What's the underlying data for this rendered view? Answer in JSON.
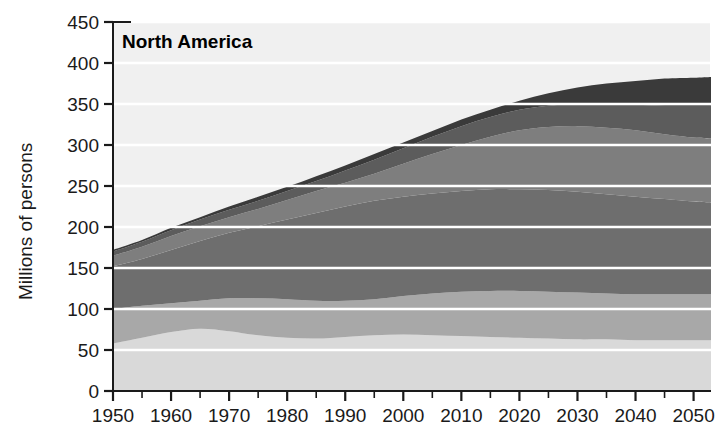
{
  "chart_data": {
    "type": "area",
    "title": "North America",
    "xlabel": "",
    "ylabel": "Millions of persons",
    "xlim": [
      1950,
      2053
    ],
    "ylim": [
      0,
      450
    ],
    "ytick_step": 50,
    "ytick_labels": [
      "0",
      "50",
      "100",
      "150",
      "200",
      "250",
      "300",
      "350",
      "400",
      "450"
    ],
    "ytick_values": [
      0,
      50,
      100,
      150,
      200,
      250,
      300,
      350,
      400,
      450
    ],
    "xtick_labels": [
      "1950",
      "1960",
      "1970",
      "1980",
      "1990",
      "2000",
      "2010",
      "2020",
      "2030",
      "2040",
      "2050"
    ],
    "xtick_values": [
      1950,
      1960,
      1970,
      1980,
      1990,
      2000,
      2010,
      2020,
      2030,
      2040,
      2050
    ],
    "minor_xtick_step": 5,
    "grid": "horizontal-white-lines",
    "legend": "none",
    "stacked": true,
    "x": [
      1950,
      1955,
      1960,
      1965,
      1970,
      1975,
      1980,
      1985,
      1990,
      1995,
      2000,
      2005,
      2010,
      2015,
      2020,
      2025,
      2030,
      2035,
      2040,
      2045,
      2050,
      2053
    ],
    "series": [
      {
        "name": "band-1-bottom",
        "color": "#d9d9d9",
        "cumulative": [
          58,
          65,
          72,
          76,
          73,
          68,
          65,
          64,
          66,
          68,
          69,
          68,
          67,
          66,
          65,
          64,
          63,
          63,
          62,
          62,
          62,
          62
        ]
      },
      {
        "name": "band-2",
        "color": "#a8a8a8",
        "cumulative": [
          100,
          104,
          107,
          110,
          113,
          113,
          112,
          110,
          110,
          112,
          116,
          119,
          121,
          122,
          122,
          121,
          120,
          119,
          118,
          118,
          118,
          118
        ]
      },
      {
        "name": "band-3",
        "color": "#6e6e6e",
        "cumulative": [
          152,
          161,
          172,
          183,
          193,
          201,
          209,
          217,
          225,
          232,
          237,
          241,
          244,
          246,
          246,
          245,
          243,
          240,
          237,
          234,
          231,
          230
        ]
      },
      {
        "name": "band-4",
        "color": "#7e7e7e",
        "cumulative": [
          165,
          176,
          189,
          201,
          212,
          222,
          233,
          244,
          254,
          265,
          277,
          289,
          300,
          310,
          318,
          322,
          323,
          321,
          318,
          313,
          309,
          308
        ]
      },
      {
        "name": "band-5",
        "color": "#5c5c5c",
        "cumulative": [
          170,
          182,
          196,
          209,
          221,
          232,
          244,
          256,
          269,
          282,
          296,
          310,
          323,
          334,
          343,
          348,
          350,
          350,
          349,
          348,
          348,
          348
        ]
      },
      {
        "name": "band-6-top",
        "color": "#3a3a3a",
        "cumulative": [
          172,
          184,
          199,
          212,
          225,
          237,
          249,
          262,
          275,
          289,
          303,
          317,
          331,
          343,
          354,
          363,
          370,
          375,
          378,
          381,
          382,
          383
        ]
      }
    ]
  },
  "axes": {
    "y_axis_label": "Millions of persons",
    "title_text": "North America"
  },
  "colors": {
    "plot_background": "#f0f0f0",
    "gridline": "#ffffff",
    "axis": "#1a1a1a",
    "text": "#1a1a1a"
  }
}
